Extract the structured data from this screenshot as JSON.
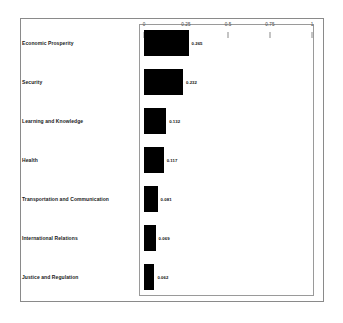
{
  "chart_data": {
    "type": "bar",
    "orientation": "horizontal",
    "title": "",
    "subtitle": "",
    "xlabel": "",
    "ylabel": "",
    "xlim": [
      0,
      1
    ],
    "grid": false,
    "legend": null,
    "bar_color": "#000000",
    "frame_color": "#8a8a8a",
    "xticks": [
      "0",
      "0.25",
      "0.5",
      "0.75",
      "1"
    ],
    "xtick_values": [
      0,
      0.25,
      0.5,
      0.75,
      1
    ],
    "categories": [
      "Economic Prosperity",
      "Security",
      "Learning and Knowledge",
      "Health",
      "Transportation and Communication",
      "International Relations",
      "Justice and Regulation"
    ],
    "values": [
      0.265,
      0.232,
      0.132,
      0.117,
      0.081,
      0.069,
      0.062
    ],
    "value_labels": [
      "0.265",
      "0.232",
      "0.132",
      "0.117",
      "0.081",
      "0.069",
      "0.062"
    ]
  }
}
